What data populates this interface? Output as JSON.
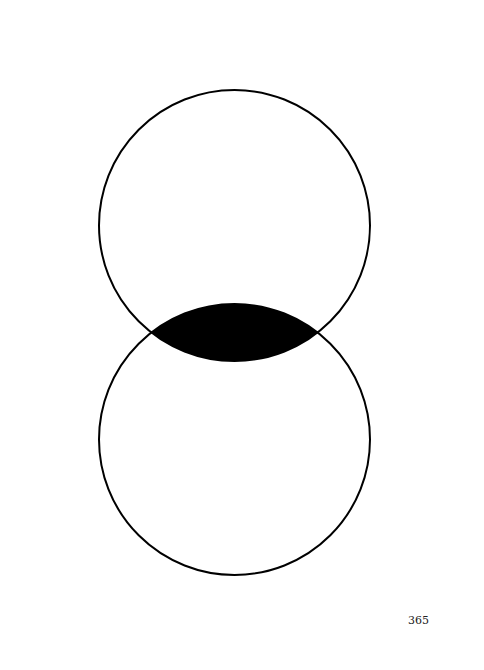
{
  "page": {
    "page_number": "365"
  },
  "diagram": {
    "type": "two-circle-venn",
    "circles": [
      {
        "name": "upper-circle"
      },
      {
        "name": "lower-circle"
      }
    ],
    "intersection": {
      "filled": true,
      "color": "#000000"
    },
    "stroke_color": "#000000",
    "background": "#ffffff"
  }
}
